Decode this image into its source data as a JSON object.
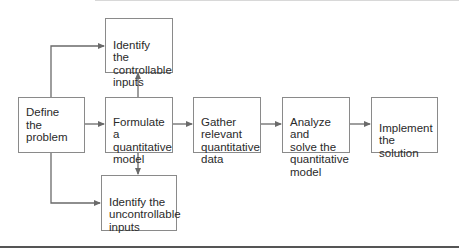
{
  "diagram": {
    "nodes": {
      "define": {
        "label": "Define the\nproblem"
      },
      "formulate": {
        "label": "Formulate a\nquantitative\nmodel"
      },
      "controllable": {
        "label": "Identify the\ncontrollable\ninputs"
      },
      "uncontrollable": {
        "label": "Identify the\nuncontrollable\ninputs"
      },
      "gather": {
        "label": "Gather\nrelevant\nquantitative\ndata"
      },
      "analyze": {
        "label": "Analyze and\nsolve the\nquantitative\nmodel"
      },
      "implement": {
        "label": "Implement\nthe solution"
      }
    },
    "edges": [
      {
        "from": "define",
        "to": "formulate"
      },
      {
        "from": "define",
        "to": "controllable"
      },
      {
        "from": "define",
        "to": "uncontrollable"
      },
      {
        "from": "formulate",
        "to": "controllable"
      },
      {
        "from": "formulate",
        "to": "uncontrollable"
      },
      {
        "from": "formulate",
        "to": "gather"
      },
      {
        "from": "gather",
        "to": "analyze"
      },
      {
        "from": "analyze",
        "to": "implement"
      }
    ],
    "colors": {
      "line": "#6a6a6a",
      "border": "#8a8a8a",
      "text": "#2a2a2a",
      "rule": "#555555"
    }
  }
}
